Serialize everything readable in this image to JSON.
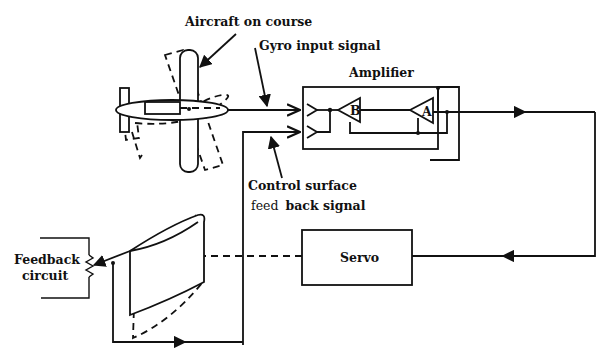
{
  "diagram": {
    "labels": {
      "aircraft": "Aircraft on course",
      "gyro_signal": "Gyro input  signal",
      "amplifier": "Amplifier",
      "control_surface_line1": "Control surface",
      "control_surface_line2_a": "feed",
      "control_surface_line2_b": "back signal",
      "servo": "Servo",
      "feedback_line1": "Feedback",
      "feedback_line2": "circuit",
      "amp_stage_b": "B",
      "amp_stage_a": "A"
    },
    "nodes": [
      {
        "id": "aircraft",
        "label": "Aircraft on course"
      },
      {
        "id": "amplifier",
        "label": "Amplifier",
        "stages": [
          "B",
          "A"
        ]
      },
      {
        "id": "servo",
        "label": "Servo"
      },
      {
        "id": "control-surface",
        "label": ""
      },
      {
        "id": "feedback-circuit",
        "label": "Feedback circuit"
      }
    ],
    "edges": [
      {
        "from": "aircraft",
        "to": "amplifier",
        "label": "Gyro input signal"
      },
      {
        "from": "amplifier",
        "to": "servo",
        "label": ""
      },
      {
        "from": "servo",
        "to": "control-surface",
        "label": "",
        "style": "dashed"
      },
      {
        "from": "control-surface",
        "to": "feedback-circuit",
        "label": ""
      },
      {
        "from": "feedback-circuit",
        "to": "amplifier",
        "label": "Control surface feedback signal"
      }
    ],
    "colors": {
      "ink": "#111111",
      "background": "#ffffff"
    }
  }
}
